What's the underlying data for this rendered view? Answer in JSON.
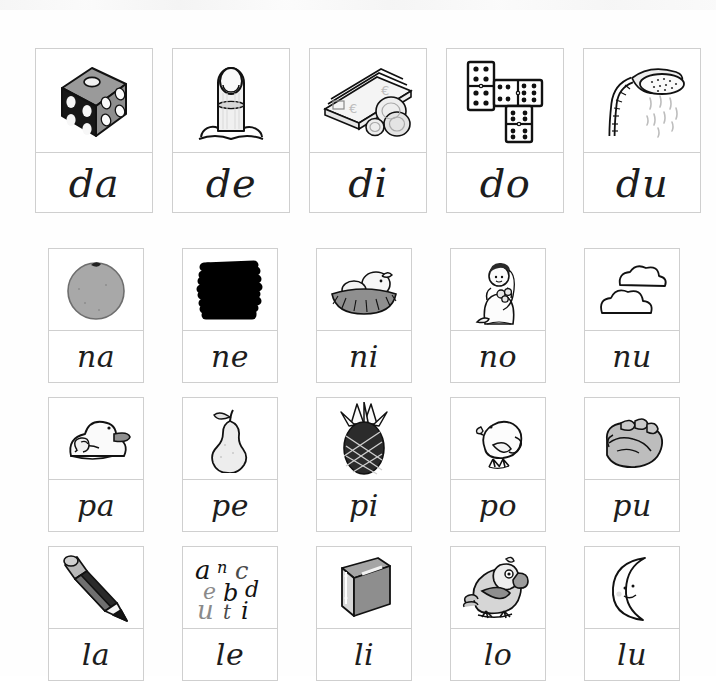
{
  "worksheet": {
    "title": "Syllable picture cards — da de di do du / na ne ni no nu / pa pe pi po pu / la le li lo lu",
    "background_color": "#ffffff",
    "border_color": "#cfcfcf",
    "text_color": "#1d1d1d"
  },
  "rows": [
    {
      "id": "row-d",
      "consonant": "d",
      "cards": [
        {
          "syllable": "da",
          "picture": "dice-icon",
          "picture_label": "dado"
        },
        {
          "syllable": "de",
          "picture": "finger-icon",
          "picture_label": "dedo"
        },
        {
          "syllable": "di",
          "picture": "money-icon",
          "picture_label": "dinero"
        },
        {
          "syllable": "do",
          "picture": "dominoes-icon",
          "picture_label": "domino"
        },
        {
          "syllable": "du",
          "picture": "shower-icon",
          "picture_label": "ducha"
        }
      ]
    },
    {
      "id": "row-n",
      "consonant": "n",
      "cards": [
        {
          "syllable": "na",
          "picture": "orange-icon",
          "picture_label": "naranja"
        },
        {
          "syllable": "ne",
          "picture": "black-scribble-icon",
          "picture_label": "negro"
        },
        {
          "syllable": "ni",
          "picture": "nest-icon",
          "picture_label": "nido"
        },
        {
          "syllable": "no",
          "picture": "bride-icon",
          "picture_label": "novia"
        },
        {
          "syllable": "nu",
          "picture": "clouds-icon",
          "picture_label": "nubes"
        }
      ]
    },
    {
      "id": "row-p",
      "consonant": "p",
      "cards": [
        {
          "syllable": "pa",
          "picture": "duck-icon",
          "picture_label": "pato"
        },
        {
          "syllable": "pe",
          "picture": "pear-icon",
          "picture_label": "pera"
        },
        {
          "syllable": "pi",
          "picture": "pineapple-icon",
          "picture_label": "pina"
        },
        {
          "syllable": "po",
          "picture": "chick-icon",
          "picture_label": "pollito"
        },
        {
          "syllable": "pu",
          "picture": "fist-icon",
          "picture_label": "puno"
        }
      ]
    },
    {
      "id": "row-l",
      "consonant": "l",
      "cards": [
        {
          "syllable": "la",
          "picture": "pencil-icon",
          "picture_label": "lapiz"
        },
        {
          "syllable": "le",
          "picture": "letters-icon",
          "picture_label": "letras"
        },
        {
          "syllable": "li",
          "picture": "book-icon",
          "picture_label": "libro"
        },
        {
          "syllable": "lo",
          "picture": "parrot-icon",
          "picture_label": "loro"
        },
        {
          "syllable": "lu",
          "picture": "moon-icon",
          "picture_label": "luna"
        }
      ]
    }
  ],
  "letters_card_glyphs": [
    "a",
    "n",
    "c",
    "e",
    "b",
    "d",
    "u",
    "t",
    "i"
  ]
}
